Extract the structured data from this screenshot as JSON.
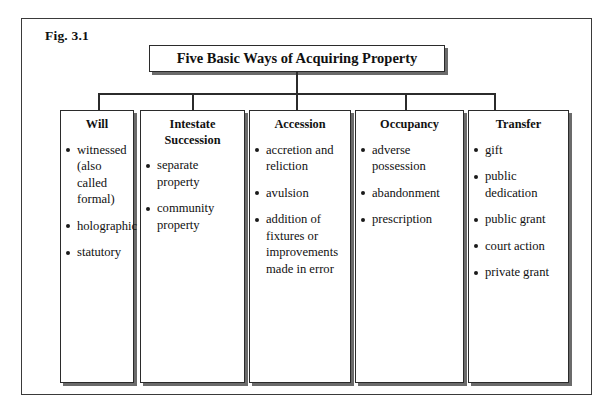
{
  "figure": {
    "label": "Fig. 3.1",
    "title": "Five Basic Ways of Acquiring Property"
  },
  "columns": [
    {
      "id": "will",
      "heading_lines": [
        "Will"
      ],
      "items": [
        {
          "lines": [
            "witnessed",
            "(also called",
            "formal)"
          ]
        },
        {
          "lines": [
            "holographic"
          ]
        },
        {
          "lines": [
            "statutory"
          ]
        }
      ]
    },
    {
      "id": "intestate",
      "heading_lines": [
        "Intestate",
        "Succession"
      ],
      "items": [
        {
          "lines": [
            "separate",
            "property"
          ]
        },
        {
          "lines": [
            "community",
            "property"
          ]
        }
      ]
    },
    {
      "id": "accession",
      "heading_lines": [
        "Accession"
      ],
      "items": [
        {
          "lines": [
            "accretion and",
            "reliction"
          ]
        },
        {
          "lines": [
            "avulsion"
          ]
        },
        {
          "lines": [
            "addition of",
            "fixtures or",
            "improvements",
            "made in error"
          ]
        }
      ]
    },
    {
      "id": "occupancy",
      "heading_lines": [
        "Occupancy"
      ],
      "items": [
        {
          "lines": [
            "adverse",
            "possession"
          ]
        },
        {
          "lines": [
            "abandonment"
          ]
        },
        {
          "lines": [
            "prescription"
          ]
        }
      ]
    },
    {
      "id": "transfer",
      "heading_lines": [
        "Transfer"
      ],
      "items": [
        {
          "lines": [
            "gift"
          ]
        },
        {
          "lines": [
            "public",
            "dedication"
          ]
        },
        {
          "lines": [
            "public grant"
          ]
        },
        {
          "lines": [
            "court action"
          ]
        },
        {
          "lines": [
            "private grant"
          ]
        }
      ]
    }
  ],
  "style": {
    "line_color": "#2b2b2b",
    "shadow_color": "#6b6b6b",
    "frame_color": "#3a3a3a",
    "background": "#ffffff"
  }
}
